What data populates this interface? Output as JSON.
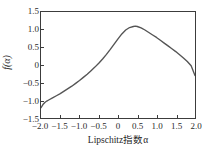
{
  "chart_data": {
    "type": "line",
    "title": "",
    "xlabel": "Lipschitz指数α",
    "ylabel": "f(α)",
    "xlim": [
      -2.0,
      2.0
    ],
    "ylim": [
      -1.5,
      1.5
    ],
    "grid": false,
    "legend": null,
    "line_color": "#555555",
    "xticks": [
      "-2.0",
      "-1.5",
      "-1.0",
      "-0.5",
      "0",
      "0.5",
      "1.0",
      "1.5",
      "2.0"
    ],
    "xtick_values": [
      -2.0,
      -1.5,
      -1.0,
      -0.5,
      0,
      0.5,
      1.0,
      1.5,
      2.0
    ],
    "yticks": [
      "1.5",
      "1.0",
      "0.5",
      "0",
      "-0.5",
      "-1.0",
      "-1.5"
    ],
    "ytick_values": [
      1.5,
      1.0,
      0.5,
      0,
      -0.5,
      -1.0,
      -1.5
    ],
    "series": [
      {
        "name": "f(α)",
        "x": [
          -2.0,
          -1.95,
          -1.9,
          -1.85,
          -1.8,
          -1.7,
          -1.6,
          -1.5,
          -1.4,
          -1.3,
          -1.2,
          -1.1,
          -1.0,
          -0.9,
          -0.8,
          -0.7,
          -0.6,
          -0.5,
          -0.4,
          -0.3,
          -0.2,
          -0.1,
          0.0,
          0.1,
          0.2,
          0.3,
          0.4,
          0.45,
          0.5,
          0.6,
          0.7,
          0.8,
          0.9,
          1.0,
          1.1,
          1.2,
          1.3,
          1.4,
          1.5,
          1.6,
          1.7,
          1.8,
          1.9,
          2.0
        ],
        "y": [
          -1.21,
          -1.12,
          -1.06,
          -1.02,
          -0.99,
          -0.93,
          -0.87,
          -0.81,
          -0.74,
          -0.67,
          -0.6,
          -0.52,
          -0.44,
          -0.35,
          -0.26,
          -0.16,
          -0.06,
          0.05,
          0.17,
          0.3,
          0.44,
          0.59,
          0.74,
          0.88,
          0.99,
          1.06,
          1.09,
          1.1,
          1.09,
          1.05,
          0.99,
          0.92,
          0.85,
          0.78,
          0.7,
          0.62,
          0.54,
          0.46,
          0.38,
          0.29,
          0.2,
          0.1,
          -0.02,
          -0.3
        ]
      }
    ],
    "peak": {
      "x": 0.45,
      "y": 1.1
    },
    "left_endpoint": {
      "x": -2.0,
      "y": -1.21
    },
    "right_endpoint": {
      "x": 2.0,
      "y": -0.3
    }
  }
}
